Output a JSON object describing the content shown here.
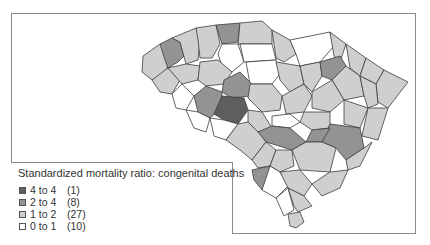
{
  "map": {
    "region": "South Carolina counties",
    "legend": {
      "title": "Standardized mortality ratio: congenital deaths",
      "items": [
        {
          "range": "4 to 4",
          "count": "(1)",
          "color": "#5e5e5e"
        },
        {
          "range": "2 to 4",
          "count": "(8)",
          "color": "#939393"
        },
        {
          "range": "1 to 2",
          "count": "(27)",
          "color": "#cfcfcf"
        },
        {
          "range": "0 to 1",
          "count": "(10)",
          "color": "#ffffff"
        }
      ]
    },
    "colors": {
      "darkest": "#5e5e5e",
      "dark": "#939393",
      "light": "#cfcfcf",
      "white": "#ffffff",
      "border": "#3c3c3c"
    }
  }
}
